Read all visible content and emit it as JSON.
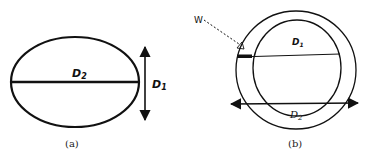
{
  "figure_a": {
    "caption": "(a)",
    "horizontal_label": "D",
    "horizontal_sub": "2",
    "vertical_label": "D",
    "vertical_sub": "1"
  },
  "figure_b": {
    "caption": "(b)",
    "pointer_label": "W",
    "inner_label": "D",
    "inner_sub": "1",
    "arrow_label": "D",
    "arrow_sub": "2"
  },
  "colors": {
    "stroke": "#111111",
    "background": "#ffffff"
  }
}
